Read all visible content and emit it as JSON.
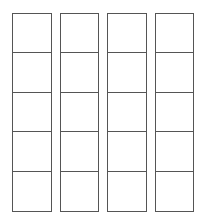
{
  "sheet": {
    "title": "Blank Grid Template",
    "background_color": "#ffffff",
    "border_color": "#555555",
    "cell_fill_color": "#ffffff",
    "border_width_px": 1.5,
    "columns": 4,
    "rows_per_column": 5,
    "total_cells": 20,
    "column_width_px": 39.5,
    "column_gap_px": 6,
    "row_height_px": 39.6
  },
  "columns": [
    {
      "name": "column-1",
      "cells": [
        {
          "name": "cell-r1c1",
          "value": ""
        },
        {
          "name": "cell-r2c1",
          "value": ""
        },
        {
          "name": "cell-r3c1",
          "value": ""
        },
        {
          "name": "cell-r4c1",
          "value": ""
        },
        {
          "name": "cell-r5c1",
          "value": ""
        }
      ]
    },
    {
      "name": "column-2",
      "cells": [
        {
          "name": "cell-r1c2",
          "value": ""
        },
        {
          "name": "cell-r2c2",
          "value": ""
        },
        {
          "name": "cell-r3c2",
          "value": ""
        },
        {
          "name": "cell-r4c2",
          "value": ""
        },
        {
          "name": "cell-r5c2",
          "value": ""
        }
      ]
    },
    {
      "name": "column-3",
      "cells": [
        {
          "name": "cell-r1c3",
          "value": ""
        },
        {
          "name": "cell-r2c3",
          "value": ""
        },
        {
          "name": "cell-r3c3",
          "value": ""
        },
        {
          "name": "cell-r4c3",
          "value": ""
        },
        {
          "name": "cell-r5c3",
          "value": ""
        }
      ]
    },
    {
      "name": "column-4",
      "cells": [
        {
          "name": "cell-r1c4",
          "value": ""
        },
        {
          "name": "cell-r2c4",
          "value": ""
        },
        {
          "name": "cell-r3c4",
          "value": ""
        },
        {
          "name": "cell-r4c4",
          "value": ""
        },
        {
          "name": "cell-r5c4",
          "value": ""
        }
      ]
    }
  ]
}
